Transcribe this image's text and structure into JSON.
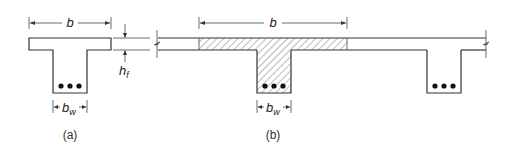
{
  "figure": {
    "panel_a": {
      "caption": "(a)",
      "dim_b_label": "b",
      "dim_bw_label": "b",
      "dim_bw_sub": "w",
      "dim_hf_label": "h",
      "dim_hf_sub": "f",
      "bars": 3
    },
    "panel_b": {
      "caption": "(b)",
      "dim_b_label": "b",
      "dim_bw_label": "b",
      "dim_bw_sub": "w",
      "bars_hatched_web": 3,
      "bars_adjacent_web": 3
    },
    "colors": {
      "line": "#333333",
      "hatch": "#555555",
      "background": "#ffffff"
    }
  }
}
